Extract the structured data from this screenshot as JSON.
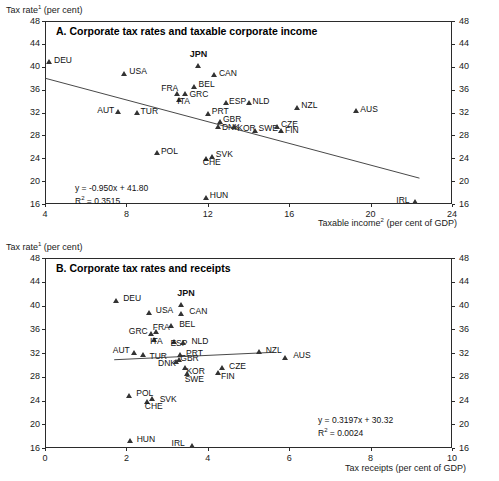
{
  "figure": {
    "panels": [
      {
        "id": "A",
        "title": "A. Corporate tax rates and taxable corporate income",
        "ylabel": "Tax rate",
        "ylabel_sup": "1",
        "ylabel_unit": " (per cent)",
        "xlabel": "Taxable income",
        "xlabel_sup": "2",
        "xlabel_unit": " (per cent of GDP)",
        "equation": "y   = -0.950x + 41.80",
        "r2_prefix": "R",
        "r2_sup": "2",
        "r2_value": " = 0.3515"
      },
      {
        "id": "B",
        "title": "B. Corporate tax rates and receipts",
        "ylabel": "Tax rate",
        "ylabel_sup": "1",
        "ylabel_unit": " (per cent)",
        "xlabel": "Tax receipts",
        "xlabel_sup": "",
        "xlabel_unit": " (per cent of GDP)",
        "equation": "y   = 0.3197x + 30.32",
        "r2_prefix": "R",
        "r2_sup": "2",
        "r2_value": " = 0.0024"
      }
    ]
  },
  "chart_data": [
    {
      "type": "scatter",
      "panel": "A",
      "title": "A. Corporate tax rates and taxable corporate income",
      "xlabel": "Taxable income (per cent of GDP)",
      "ylabel": "Tax rate (per cent)",
      "xlim": [
        4,
        24
      ],
      "ylim": [
        16,
        48
      ],
      "xticks": [
        4,
        8,
        12,
        16,
        20,
        24
      ],
      "yticks": [
        16,
        20,
        24,
        28,
        32,
        36,
        40,
        44,
        48
      ],
      "grid": false,
      "legend": "none",
      "trendline": {
        "slope": -0.95,
        "intercept": 41.8,
        "r2": 0.3515,
        "label": "y   = -0.950x + 41.80",
        "r2_label": "R2 = 0.3515"
      },
      "points": [
        {
          "label": "DEU",
          "x": 4.2,
          "y": 40.9,
          "lx": 5,
          "ly": -4
        },
        {
          "label": "USA",
          "x": 7.9,
          "y": 38.9,
          "lx": 5,
          "ly": -4
        },
        {
          "label": "JPN",
          "x": 11.5,
          "y": 40.3,
          "lx": -8,
          "ly": -13,
          "bold": true
        },
        {
          "label": "CAN",
          "x": 12.3,
          "y": 38.6,
          "lx": 5,
          "ly": -4
        },
        {
          "label": "BEL",
          "x": 11.3,
          "y": 36.6,
          "lx": 5,
          "ly": -4
        },
        {
          "label": "FRA",
          "x": 10.5,
          "y": 35.4,
          "lx": -16,
          "ly": -7
        },
        {
          "label": "GRC",
          "x": 10.9,
          "y": 35.3,
          "lx": 4,
          "ly": -2
        },
        {
          "label": "ITA",
          "x": 10.6,
          "y": 34.3,
          "lx": -2,
          "ly": 0
        },
        {
          "label": "ESP",
          "x": 12.9,
          "y": 33.8,
          "lx": 3,
          "ly": -3
        },
        {
          "label": "NLD",
          "x": 14.0,
          "y": 33.7,
          "lx": 4,
          "ly": -4
        },
        {
          "label": "AUT",
          "x": 7.6,
          "y": 32.1,
          "lx": -21,
          "ly": -4
        },
        {
          "label": "TUR",
          "x": 8.5,
          "y": 32.0,
          "lx": 4,
          "ly": -4
        },
        {
          "label": "PRT",
          "x": 12.0,
          "y": 31.9,
          "lx": 4,
          "ly": -4
        },
        {
          "label": "GBR",
          "x": 12.6,
          "y": 30.4,
          "lx": 3,
          "ly": -5
        },
        {
          "label": "DNK",
          "x": 12.5,
          "y": 29.6,
          "lx": 4,
          "ly": -1
        },
        {
          "label": "KOR",
          "x": 13.3,
          "y": 29.5,
          "lx": 3,
          "ly": -1
        },
        {
          "label": "SWE",
          "x": 14.3,
          "y": 28.9,
          "lx": 4,
          "ly": -4
        },
        {
          "label": "CZE",
          "x": 15.4,
          "y": 29.6,
          "lx": 4,
          "ly": -4
        },
        {
          "label": "FIN",
          "x": 15.6,
          "y": 28.8,
          "lx": 4,
          "ly": -3
        },
        {
          "label": "NZL",
          "x": 16.4,
          "y": 32.9,
          "lx": 4,
          "ly": -4
        },
        {
          "label": "AUS",
          "x": 19.3,
          "y": 32.3,
          "lx": 4,
          "ly": -4
        },
        {
          "label": "POL",
          "x": 9.5,
          "y": 25.0,
          "lx": 4,
          "ly": -4
        },
        {
          "label": "SVK",
          "x": 12.2,
          "y": 24.3,
          "lx": 4,
          "ly": -5
        },
        {
          "label": "CHE",
          "x": 11.9,
          "y": 23.9,
          "lx": -3,
          "ly": 1
        },
        {
          "label": "HUN",
          "x": 11.9,
          "y": 17.2,
          "lx": 4,
          "ly": -4
        },
        {
          "label": "IRL",
          "x": 22.2,
          "y": 16.4,
          "lx": -19,
          "ly": -4
        }
      ]
    },
    {
      "type": "scatter",
      "panel": "B",
      "title": "B. Corporate tax rates and receipts",
      "xlabel": "Tax receipts (per cent of GDP)",
      "ylabel": "Tax rate (per cent)",
      "xlim": [
        0,
        10
      ],
      "ylim": [
        16,
        48
      ],
      "xticks": [
        0,
        2,
        4,
        6,
        8,
        10
      ],
      "yticks": [
        16,
        20,
        24,
        28,
        32,
        36,
        40,
        44,
        48
      ],
      "grid": false,
      "legend": "none",
      "trendline": {
        "slope": 0.3197,
        "intercept": 30.32,
        "r2": 0.0024,
        "label": "y   = 0.3197x + 30.32",
        "r2_label": "R2 = 0.0024"
      },
      "points": [
        {
          "label": "DEU",
          "x": 1.75,
          "y": 40.9,
          "lx": 7,
          "ly": -4
        },
        {
          "label": "USA",
          "x": 2.55,
          "y": 38.9,
          "lx": 7,
          "ly": -4
        },
        {
          "label": "JPN",
          "x": 3.35,
          "y": 40.2,
          "lx": -4,
          "ly": -13,
          "bold": true
        },
        {
          "label": "CAN",
          "x": 3.35,
          "y": 38.7,
          "lx": 8,
          "ly": -4
        },
        {
          "label": "BEL",
          "x": 3.1,
          "y": 36.6,
          "lx": 8,
          "ly": -4
        },
        {
          "label": "FRA",
          "x": 2.72,
          "y": 35.6,
          "lx": -3,
          "ly": -7
        },
        {
          "label": "GRC",
          "x": 2.6,
          "y": 35.3,
          "lx": -22,
          "ly": -4
        },
        {
          "label": "ITA",
          "x": 2.68,
          "y": 34.3,
          "lx": -4,
          "ly": 0
        },
        {
          "label": "ESP",
          "x": 3.18,
          "y": 33.9,
          "lx": -4,
          "ly": -1
        },
        {
          "label": "NLD",
          "x": 3.4,
          "y": 33.8,
          "lx": 8,
          "ly": -3
        },
        {
          "label": "AUT",
          "x": 2.18,
          "y": 32.1,
          "lx": -21,
          "ly": -4
        },
        {
          "label": "TUR",
          "x": 2.42,
          "y": 31.7,
          "lx": 6,
          "ly": -1
        },
        {
          "label": "PRT",
          "x": 3.32,
          "y": 31.8,
          "lx": 6,
          "ly": -3
        },
        {
          "label": "GBR",
          "x": 3.3,
          "y": 30.9,
          "lx": 1,
          "ly": -4
        },
        {
          "label": "DNK",
          "x": 3.22,
          "y": 30.5,
          "lx": -18,
          "ly": -1
        },
        {
          "label": "KOR",
          "x": 3.45,
          "y": 29.5,
          "lx": 1,
          "ly": 1
        },
        {
          "label": "SWE",
          "x": 3.48,
          "y": 28.6,
          "lx": -2,
          "ly": 4
        },
        {
          "label": "CZE",
          "x": 4.35,
          "y": 29.6,
          "lx": 7,
          "ly": -3
        },
        {
          "label": "FIN",
          "x": 4.25,
          "y": 28.8,
          "lx": 3,
          "ly": 2
        },
        {
          "label": "NZL",
          "x": 5.25,
          "y": 32.2,
          "lx": 7,
          "ly": -4
        },
        {
          "label": "AUS",
          "x": 5.9,
          "y": 31.3,
          "lx": 8,
          "ly": -4
        },
        {
          "label": "POL",
          "x": 2.07,
          "y": 24.9,
          "lx": 7,
          "ly": -4
        },
        {
          "label": "SVK",
          "x": 2.62,
          "y": 24.3,
          "lx": 8,
          "ly": -2
        },
        {
          "label": "CHE",
          "x": 2.5,
          "y": 23.9,
          "lx": -2,
          "ly": 3
        },
        {
          "label": "HUN",
          "x": 2.08,
          "y": 17.2,
          "lx": 7,
          "ly": -4
        },
        {
          "label": "IRL",
          "x": 3.6,
          "y": 16.5,
          "lx": -20,
          "ly": -4
        }
      ]
    }
  ]
}
